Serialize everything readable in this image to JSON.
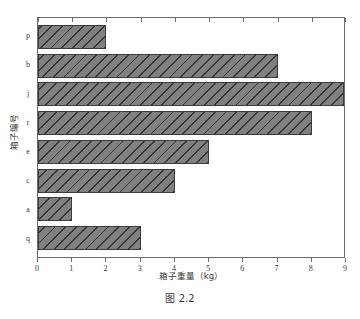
{
  "caption": "图 2.2",
  "chart_data": {
    "type": "bar",
    "orientation": "horizontal",
    "title": "",
    "xlabel": "箱子重量（kg）",
    "ylabel": "箱子编号",
    "categories": [
      "p",
      "b",
      "j",
      "r",
      "e",
      "c",
      "a",
      "q"
    ],
    "values": [
      2,
      7,
      9,
      8,
      5,
      4,
      1,
      3
    ],
    "xlim": [
      0,
      9
    ],
    "xticks": [
      "0",
      "1",
      "2",
      "3",
      "4",
      "5",
      "6",
      "7",
      "8",
      "9"
    ],
    "grid": false,
    "legend": null,
    "bar_color": "#808080",
    "bar_edge_color": "#3c3c3c",
    "hatch": "///",
    "background": "#ffffff"
  }
}
